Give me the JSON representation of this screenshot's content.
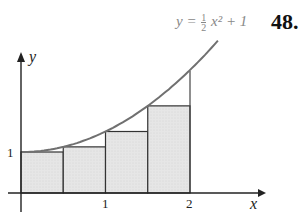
{
  "problem_number": "48.",
  "equation": {
    "lhs": "y =",
    "frac_num": "1",
    "frac_den": "2",
    "rhs": "x² + 1"
  },
  "axes": {
    "x_label": "x",
    "y_label": "y",
    "x_ticks": [
      "1",
      "2"
    ],
    "y_ticks": [
      "1"
    ]
  },
  "chart_data": {
    "type": "area",
    "function": "0.5*x^2+1",
    "x_range": [
      0,
      2
    ],
    "rectangles": [
      {
        "x0": 0,
        "x1": 0.5,
        "height": 1
      },
      {
        "x0": 0.5,
        "x1": 1,
        "height": 1.125
      },
      {
        "x0": 1,
        "x1": 1.5,
        "height": 1.5
      },
      {
        "x0": 1.5,
        "x1": 2,
        "height": 2.125
      }
    ],
    "xlabel": "x",
    "ylabel": "y",
    "x_ticks": [
      1,
      2
    ],
    "y_ticks": [
      1
    ],
    "colors": {
      "curve": "#6f6f6f",
      "fill": "#e4e4e4",
      "stroke": "#333333"
    }
  }
}
